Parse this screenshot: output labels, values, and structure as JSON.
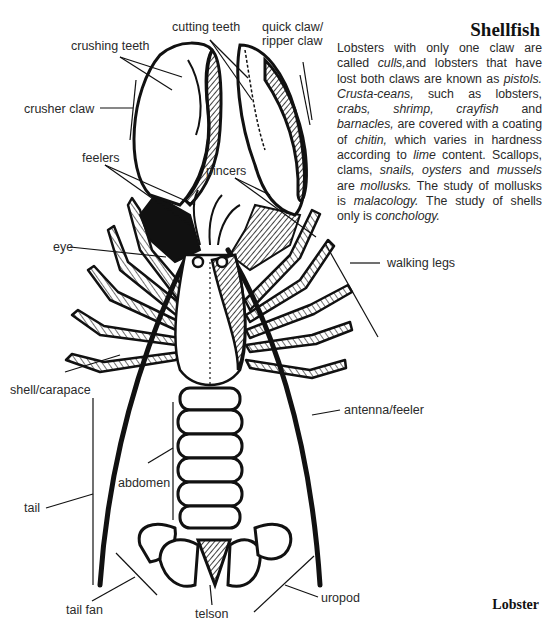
{
  "title": "Shellfish",
  "caption": "Lobster",
  "paragraph": [
    {
      "t": "Lobsters with only one claw are called ",
      "i": false
    },
    {
      "t": "culls,",
      "i": true
    },
    {
      "t": "and lobsters that have lost both claws are known as ",
      "i": false
    },
    {
      "t": "pistols.",
      "i": true
    },
    {
      "t": " ",
      "i": false
    },
    {
      "t": "Crusta-ceans,",
      "i": true
    },
    {
      "t": " such as lobsters, ",
      "i": false
    },
    {
      "t": "crabs, shrimp, crayfish",
      "i": true
    },
    {
      "t": " and ",
      "i": false
    },
    {
      "t": "barnacles,",
      "i": true
    },
    {
      "t": " are covered with a coating of ",
      "i": false
    },
    {
      "t": "chitin,",
      "i": true
    },
    {
      "t": " which varies in hardness according to ",
      "i": false
    },
    {
      "t": "lime",
      "i": true
    },
    {
      "t": " content. Scallops, clams, ",
      "i": false
    },
    {
      "t": "snails, oysters",
      "i": true
    },
    {
      "t": " and ",
      "i": false
    },
    {
      "t": "mussels",
      "i": true
    },
    {
      "t": " are ",
      "i": false
    },
    {
      "t": "mollusks.",
      "i": true
    },
    {
      "t": " The study of mollusks is ",
      "i": false
    },
    {
      "t": "malacology.",
      "i": true
    },
    {
      "t": " The study of shells only is ",
      "i": false
    },
    {
      "t": "conchology.",
      "i": true
    }
  ],
  "labels": {
    "cutting_teeth": "cutting teeth",
    "quick_claw_1": "quick claw/",
    "quick_claw_2": "ripper claw",
    "crushing_teeth": "crushing teeth",
    "crusher_claw": "crusher claw",
    "feelers": "feelers",
    "pincers": "pincers",
    "eye": "eye",
    "walking_legs": "walking legs",
    "shell_carapace": "shell/carapace",
    "antenna_feeler": "antenna/feeler",
    "abdomen": "abdomen",
    "tail": "tail",
    "tail_fan": "tail fan",
    "telson": "telson",
    "uropod": "uropod"
  },
  "colors": {
    "ink": "#111111",
    "text": "#2a2a2a",
    "paper": "#ffffff"
  }
}
